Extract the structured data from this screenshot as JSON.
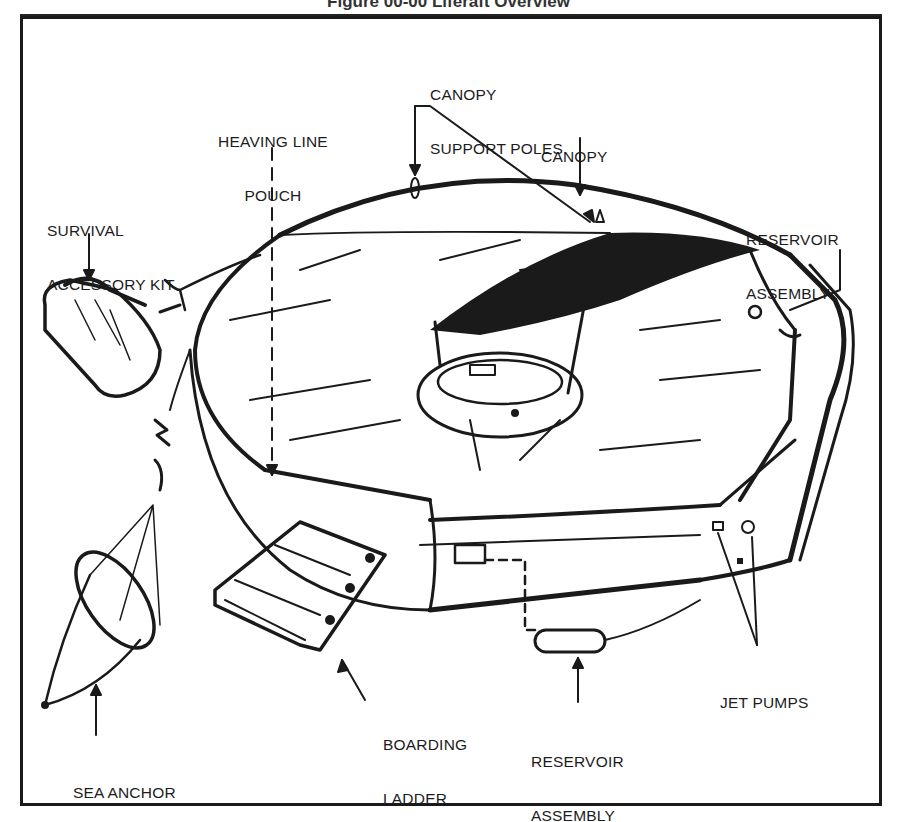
{
  "figure": {
    "caption": "Figure 00-00 Liferaft Overview",
    "labels": {
      "canopy_support_poles": [
        "CANOPY",
        "SUPPORT POLES"
      ],
      "heaving_line_pouch": [
        "HEAVING LINE",
        "POUCH"
      ],
      "canopy": [
        "CANOPY"
      ],
      "survival_accessory_kit": [
        "SURVIVAL",
        "ACCESSORY KIT"
      ],
      "reservoir_assembly_top": [
        "RESERVOIR",
        "ASSEMBLY"
      ],
      "sea_anchor": [
        "SEA ANCHOR"
      ],
      "boarding_ladder": [
        "BOARDING",
        "LADDER"
      ],
      "reservoir_assembly_bottom": [
        "RESERVOIR",
        "ASSEMBLY"
      ],
      "jet_pumps": [
        "JET PUMPS"
      ]
    },
    "colors": {
      "ink": "#1a1a1a",
      "paper": "#ffffff"
    }
  }
}
